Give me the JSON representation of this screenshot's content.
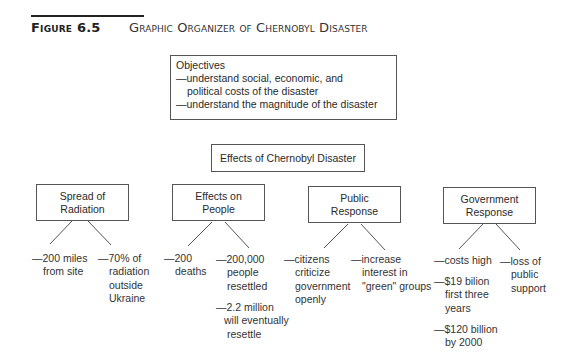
{
  "figure": {
    "label": "Figure 6.5",
    "title": "Graphic Organizer of Chernobyl Disaster"
  },
  "objectives": {
    "heading": "Objectives",
    "items": [
      {
        "first": "—understand social, economic, and",
        "rest": "political costs of the disaster"
      },
      {
        "first": "—understand the magnitude of the disaster",
        "rest": ""
      }
    ]
  },
  "central": {
    "label": "Effects of Chernobyl Disaster"
  },
  "categories": [
    {
      "line1": "Spread of",
      "line2": "Radiation",
      "details": [
        {
          "first": "—200 miles",
          "rest": [
            "from site"
          ]
        },
        {
          "first": "—70% of",
          "rest": [
            "radiation",
            "outside",
            "Ukraine"
          ]
        }
      ]
    },
    {
      "line1": "Effects on",
      "line2": "People",
      "details": [
        {
          "first": "—200",
          "rest": [
            "deaths"
          ]
        },
        {
          "first": "—200,000",
          "rest": [
            "people",
            "resettled"
          ]
        },
        {
          "first": "—2.2 million",
          "rest": [
            "will eventually",
            "resettle"
          ]
        }
      ]
    },
    {
      "line1": "Public",
      "line2": "Response",
      "details": [
        {
          "first": "—citizens",
          "rest": [
            "criticize",
            "government",
            "openly"
          ]
        },
        {
          "first": "—increase",
          "rest": [
            "interest in",
            "\"green\" groups"
          ]
        }
      ]
    },
    {
      "line1": "Government",
      "line2": "Response",
      "details": [
        {
          "first": "—costs high",
          "rest": []
        },
        {
          "first": "—loss of",
          "rest": [
            "public",
            "support"
          ]
        },
        {
          "first": "—$19 bilion",
          "rest": [
            "first three",
            "years"
          ]
        },
        {
          "first": "—$120 billion",
          "rest": [
            "by 2000"
          ]
        }
      ]
    }
  ]
}
